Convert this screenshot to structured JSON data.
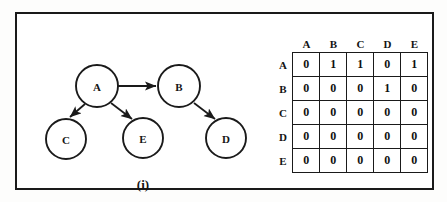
{
  "figure": {
    "caption_left": "(i)",
    "caption_right": "(ii)"
  },
  "graph": {
    "type": "directed-graph",
    "nodes": [
      {
        "id": "A",
        "label": "A",
        "cx": 80,
        "cy": 72,
        "r": 21
      },
      {
        "id": "B",
        "label": "B",
        "cx": 162,
        "cy": 72,
        "r": 21
      },
      {
        "id": "C",
        "label": "C",
        "cx": 49,
        "cy": 125,
        "r": 20
      },
      {
        "id": "E",
        "label": "E",
        "cx": 126,
        "cy": 124,
        "r": 20
      },
      {
        "id": "D",
        "label": "D",
        "cx": 209,
        "cy": 124,
        "r": 20
      }
    ],
    "edges": [
      {
        "from": "A",
        "to": "B",
        "directed": true
      },
      {
        "from": "A",
        "to": "C",
        "directed": true
      },
      {
        "from": "A",
        "to": "E",
        "directed": true
      },
      {
        "from": "B",
        "to": "D",
        "directed": true
      }
    ]
  },
  "matrix": {
    "title": "adjacency-matrix",
    "col_headers": [
      "A",
      "B",
      "C",
      "D",
      "E"
    ],
    "row_headers": [
      "A",
      "B",
      "C",
      "D",
      "E"
    ],
    "rows": [
      [
        "0",
        "1",
        "1",
        "0",
        "1"
      ],
      [
        "0",
        "0",
        "0",
        "1",
        "0"
      ],
      [
        "0",
        "0",
        "0",
        "0",
        "0"
      ],
      [
        "0",
        "0",
        "0",
        "0",
        "0"
      ],
      [
        "0",
        "0",
        "0",
        "0",
        "0"
      ]
    ]
  },
  "colors": {
    "ink": "#1a1a1a",
    "paper": "#ffffff"
  }
}
